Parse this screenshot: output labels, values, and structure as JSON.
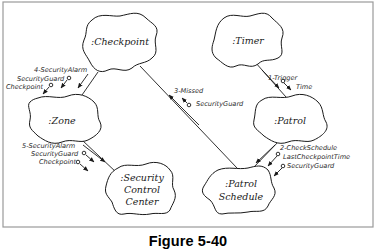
{
  "figure": {
    "caption": "Figure 5-40"
  },
  "objects": {
    "checkpoint": ":Checkpoint",
    "timer": ":Timer",
    "zone": ":Zone",
    "patrol": ":Patrol",
    "security_control_center": [
      ":Security",
      "Control",
      "Center"
    ],
    "patrol_schedule": [
      ":Patrol",
      "Schedule"
    ]
  },
  "messages": {
    "m1": {
      "label": "1-Trigger",
      "params": [
        "Time"
      ],
      "from": ":Timer",
      "to": ":Patrol"
    },
    "m2": {
      "label": "2-CheckSchedule",
      "params": [
        "LastCheckpointTime",
        "SecurityGuard"
      ],
      "from": ":Patrol",
      "to": ":Patrol Schedule"
    },
    "m3": {
      "label": "3-Missed",
      "params": [
        "SecurityGuard"
      ],
      "from": ":Patrol Schedule",
      "to": ":Checkpoint"
    },
    "m4": {
      "label": "4-SecurityAlarm",
      "params": [
        "SecurityGuard",
        "Checkpoint"
      ],
      "from": ":Checkpoint",
      "to": ":Zone"
    },
    "m5": {
      "label": "5-SecurityAlarm",
      "params": [
        "SecurityGuard",
        "Checkpoint"
      ],
      "from": ":Zone",
      "to": ":Security Control Center"
    }
  },
  "colors": {
    "ink": "#1a1a1a",
    "frame": "#9a9a9a",
    "background": "#ffffff"
  }
}
